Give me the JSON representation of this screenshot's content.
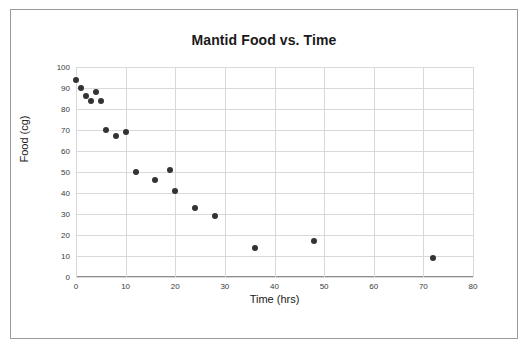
{
  "figure": {
    "title": "Mantid Food vs. Time",
    "border_color": "#9a9a9a",
    "background": "#ffffff"
  },
  "chart_data": {
    "type": "scatter",
    "title": "Mantid Food vs. Time",
    "xlabel": "Time (hrs)",
    "ylabel": "Food (cg)",
    "xlim": [
      0,
      80
    ],
    "ylim": [
      0,
      100
    ],
    "xticks": [
      0,
      10,
      20,
      30,
      40,
      50,
      60,
      70,
      80
    ],
    "yticks": [
      0,
      10,
      20,
      30,
      40,
      50,
      60,
      70,
      80,
      90,
      100
    ],
    "xtick_labels": [
      "0",
      "10",
      "20",
      "30",
      "40",
      "50",
      "60",
      "70",
      "80"
    ],
    "ytick_labels": [
      "0",
      "10",
      "20",
      "30",
      "40",
      "50",
      "60",
      "70",
      "80",
      "90",
      "100"
    ],
    "grid": true,
    "grid_color": "#d9d9d9",
    "legend": null,
    "marker_color": "#333333",
    "marker_size": 6,
    "points": [
      {
        "x": 0,
        "y": 94
      },
      {
        "x": 1,
        "y": 90
      },
      {
        "x": 2,
        "y": 86
      },
      {
        "x": 3,
        "y": 84
      },
      {
        "x": 4,
        "y": 88
      },
      {
        "x": 5,
        "y": 84
      },
      {
        "x": 6,
        "y": 70
      },
      {
        "x": 8,
        "y": 67
      },
      {
        "x": 10,
        "y": 69
      },
      {
        "x": 12,
        "y": 50
      },
      {
        "x": 16,
        "y": 46
      },
      {
        "x": 19,
        "y": 51
      },
      {
        "x": 20,
        "y": 41
      },
      {
        "x": 24,
        "y": 33
      },
      {
        "x": 28,
        "y": 29
      },
      {
        "x": 36,
        "y": 14
      },
      {
        "x": 48,
        "y": 17
      },
      {
        "x": 72,
        "y": 9
      }
    ]
  }
}
